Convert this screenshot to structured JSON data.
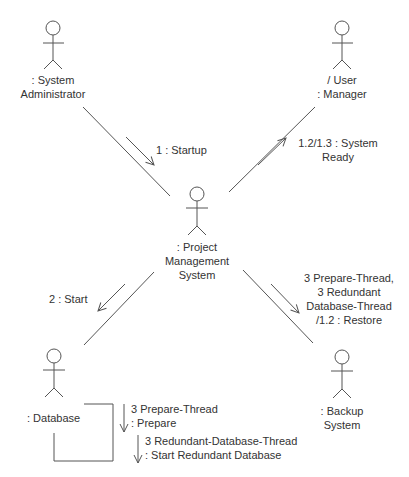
{
  "diagram": {
    "type": "UML communication diagram",
    "colors": {
      "stroke": "#555555",
      "text": "#333333",
      "background": "#ffffff"
    },
    "actors": [
      {
        "id": "sysadmin",
        "line1": ": System",
        "line2": "Administrator",
        "icon": "stick-figure-icon"
      },
      {
        "id": "usermanager",
        "line1": "/ User",
        "line2": ": Manager",
        "icon": "stick-figure-icon"
      },
      {
        "id": "pms",
        "line1": ": Project",
        "line2": "Management",
        "line3": "System",
        "icon": "stick-figure-icon"
      },
      {
        "id": "database",
        "line1": ": Database",
        "icon": "stick-figure-icon"
      },
      {
        "id": "backup",
        "line1": ": Backup",
        "line2": "System",
        "icon": "stick-figure-icon"
      }
    ],
    "messages": [
      {
        "id": "startup",
        "from": "sysadmin",
        "to": "pms",
        "line1": "1 : Startup"
      },
      {
        "id": "system_ready",
        "from": "pms",
        "to": "usermanager",
        "line1": "1.2/1.3 : System",
        "line2": "Ready"
      },
      {
        "id": "start",
        "from": "pms",
        "to": "database",
        "line1": "2 : Start"
      },
      {
        "id": "restore",
        "from": "pms",
        "to": "backup",
        "line1": "3 Prepare-Thread,",
        "line2": "3 Redundant",
        "line3": "Database-Thread",
        "line4": "/1.2 : Restore"
      },
      {
        "id": "prepare",
        "from": "database",
        "to": "database",
        "line1": "3 Prepare-Thread",
        "line2": ": Prepare"
      },
      {
        "id": "start_redundant",
        "from": "database",
        "to": "database",
        "line1": "3 Redundant-Database-Thread",
        "line2": ": Start Redundant Database"
      }
    ]
  }
}
